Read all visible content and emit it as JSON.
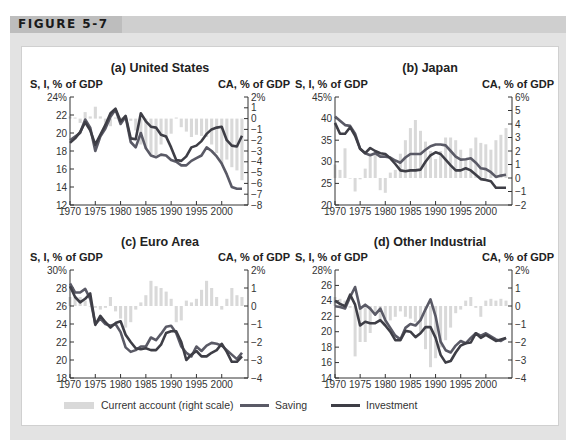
{
  "figure": {
    "label": "FIGURE 5-7"
  },
  "legend": {
    "current_account": "Current account (right scale)",
    "saving": "Saving",
    "investment": "Investment"
  },
  "colors": {
    "saving": "#5a5a66",
    "investment": "#3e3e46",
    "current_account": "#d9d9d9",
    "frame": "#e3e3e3",
    "header_band": "#cfcfcf"
  },
  "chart_data": [
    {
      "type": "line",
      "title": "(a) United States",
      "ylabel": "S, I, % of GDP",
      "y2label": "CA, % of GDP",
      "ylim": [
        12,
        24
      ],
      "yticks": [
        "24%",
        "22",
        "20",
        "18",
        "16",
        "14",
        "12"
      ],
      "y2lim": [
        -8,
        2
      ],
      "y2ticks": [
        "2%",
        "1",
        "0",
        "-1",
        "-2",
        "-3",
        "-4",
        "-5",
        "-6",
        "-7",
        "-8"
      ],
      "xticks": [
        "1970",
        "1975",
        "1980",
        "1985",
        "1990",
        "1995",
        "2000"
      ],
      "x": [
        1970,
        1971,
        1972,
        1973,
        1974,
        1975,
        1976,
        1977,
        1978,
        1979,
        1980,
        1981,
        1982,
        1983,
        1984,
        1985,
        1986,
        1987,
        1988,
        1989,
        1990,
        1991,
        1992,
        1993,
        1994,
        1995,
        1996,
        1997,
        1998,
        1999,
        2000,
        2001,
        2002,
        2003,
        2004
      ],
      "series": [
        {
          "name": "Saving",
          "axis": "left",
          "values": [
            19.2,
            19.6,
            20.0,
            21.5,
            20.6,
            18.0,
            19.6,
            20.5,
            21.8,
            22.6,
            21.0,
            21.8,
            19.0,
            18.4,
            20.0,
            18.3,
            17.5,
            17.3,
            17.6,
            17.5,
            17.0,
            16.8,
            16.4,
            16.4,
            16.9,
            17.2,
            17.5,
            18.4,
            18.0,
            17.4,
            16.6,
            15.4,
            14.0,
            13.8,
            13.8
          ]
        },
        {
          "name": "Investment",
          "axis": "left",
          "values": [
            18.9,
            19.4,
            20.1,
            21.2,
            20.3,
            18.7,
            19.8,
            20.9,
            22.2,
            22.7,
            21.3,
            21.9,
            19.4,
            19.3,
            22.2,
            21.3,
            20.7,
            20.6,
            19.8,
            19.6,
            18.4,
            17.0,
            16.9,
            17.4,
            18.4,
            18.6,
            19.1,
            19.9,
            20.4,
            20.6,
            20.7,
            19.2,
            18.6,
            18.5,
            19.7
          ]
        },
        {
          "name": "Current account",
          "axis": "right",
          "type": "bar",
          "values": [
            0.2,
            0.1,
            -0.4,
            0.6,
            0.2,
            1.1,
            0.2,
            -0.7,
            -0.7,
            0.1,
            0.1,
            0.2,
            -0.2,
            -1.1,
            -2.4,
            -2.8,
            -3.3,
            -3.4,
            -2.4,
            -1.8,
            -1.4,
            0.1,
            -0.8,
            -1.2,
            -1.7,
            -1.5,
            -1.6,
            -1.7,
            -2.4,
            -3.2,
            -4.2,
            -3.8,
            -4.5,
            -4.8,
            -5.7
          ]
        }
      ]
    },
    {
      "type": "line",
      "title": "(b) Japan",
      "ylabel": "S, I, % of GDP",
      "y2label": "CA, % of GDP",
      "ylim": [
        20,
        45
      ],
      "yticks": [
        "45%",
        "40",
        "35",
        "30",
        "25",
        "20"
      ],
      "y2lim": [
        -2,
        6
      ],
      "y2ticks": [
        "6%",
        "5",
        "4",
        "3",
        "2",
        "1",
        "0",
        "-1",
        "-2"
      ],
      "xticks": [
        "1970",
        "1975",
        "1980",
        "1985",
        "1990",
        "1995",
        "2000"
      ],
      "x": [
        1970,
        1971,
        1972,
        1973,
        1974,
        1975,
        1976,
        1977,
        1978,
        1979,
        1980,
        1981,
        1982,
        1983,
        1984,
        1985,
        1986,
        1987,
        1988,
        1989,
        1990,
        1991,
        1992,
        1993,
        1994,
        1995,
        1996,
        1997,
        1998,
        1999,
        2000,
        2001,
        2002,
        2003,
        2004
      ],
      "series": [
        {
          "name": "Saving",
          "axis": "left",
          "values": [
            40.5,
            39.5,
            38.5,
            38.3,
            36.5,
            33.0,
            32.0,
            31.5,
            32.0,
            31.2,
            31.2,
            31.0,
            30.3,
            29.8,
            31.0,
            31.8,
            31.8,
            31.8,
            32.8,
            33.6,
            34.0,
            34.0,
            33.8,
            32.5,
            31.2,
            30.5,
            30.6,
            30.8,
            29.8,
            28.5,
            28.3,
            27.6,
            26.5,
            26.8,
            27.0
          ]
        },
        {
          "name": "Investment",
          "axis": "left",
          "values": [
            39.0,
            36.5,
            36.5,
            38.0,
            36.0,
            33.0,
            32.0,
            33.2,
            32.5,
            32.0,
            31.8,
            30.8,
            29.5,
            28.0,
            27.8,
            28.0,
            28.0,
            28.2,
            30.0,
            31.5,
            32.2,
            31.8,
            30.5,
            29.2,
            28.0,
            28.0,
            28.5,
            28.0,
            27.0,
            26.0,
            25.8,
            25.5,
            24.0,
            24.0,
            24.0
          ]
        },
        {
          "name": "Current account",
          "axis": "right",
          "type": "bar",
          "values": [
            1.0,
            0.6,
            2.2,
            0,
            -1.0,
            -0.1,
            0.7,
            1.6,
            1.7,
            -0.9,
            -1.1,
            0.4,
            0.6,
            1.8,
            2.8,
            3.7,
            4.3,
            3.5,
            2.7,
            2.0,
            1.4,
            2.0,
            3.0,
            3.0,
            2.8,
            2.1,
            1.4,
            2.2,
            3.0,
            2.6,
            2.5,
            2.1,
            2.8,
            3.2,
            3.7
          ]
        }
      ]
    },
    {
      "type": "line",
      "title": "(c) Euro Area",
      "ylabel": "S, I, % of GDP",
      "y2label": "CA, % of GDP",
      "ylim": [
        18,
        30
      ],
      "yticks": [
        "30%",
        "28",
        "26",
        "24",
        "22",
        "20",
        "18"
      ],
      "y2lim": [
        -4,
        2
      ],
      "y2ticks": [
        "2%",
        "1",
        "0",
        "-1",
        "-2",
        "-3",
        "-4"
      ],
      "xticks": [
        "1970",
        "1975",
        "1980",
        "1985",
        "1990",
        "1995",
        "2000"
      ],
      "x": [
        1970,
        1971,
        1972,
        1973,
        1974,
        1975,
        1976,
        1977,
        1978,
        1979,
        1980,
        1981,
        1982,
        1983,
        1984,
        1985,
        1986,
        1987,
        1988,
        1989,
        1990,
        1991,
        1992,
        1993,
        1994,
        1995,
        1996,
        1997,
        1998,
        1999,
        2000,
        2001,
        2002,
        2003,
        2004
      ],
      "series": [
        {
          "name": "Saving",
          "axis": "left",
          "values": [
            28.5,
            27.5,
            27.5,
            27.9,
            26.8,
            24.0,
            24.6,
            24.0,
            23.8,
            24.0,
            23.1,
            21.4,
            20.9,
            21.1,
            21.5,
            21.5,
            22.5,
            22.2,
            22.9,
            23.7,
            23.8,
            23.0,
            21.5,
            20.8,
            20.4,
            21.5,
            21.0,
            21.6,
            21.9,
            21.8,
            21.6,
            21.1,
            20.6,
            20.1,
            20.8
          ]
        },
        {
          "name": "Investment",
          "axis": "left",
          "values": [
            28.2,
            27.0,
            26.4,
            26.8,
            27.4,
            23.9,
            24.9,
            24.2,
            23.6,
            24.1,
            24.3,
            22.8,
            22.0,
            21.3,
            21.2,
            21.3,
            21.1,
            21.1,
            21.7,
            23.0,
            23.2,
            23.2,
            22.0,
            20.0,
            20.6,
            21.0,
            20.4,
            20.4,
            20.8,
            21.1,
            21.8,
            20.9,
            19.8,
            19.8,
            20.4
          ]
        },
        {
          "name": "Current account",
          "axis": "right",
          "type": "bar",
          "values": [
            0.5,
            0.5,
            0.5,
            0.3,
            0,
            -0.1,
            -0.2,
            -0.1,
            0.5,
            -0.3,
            -0.7,
            -1.2,
            -0.9,
            -0.2,
            0.2,
            0.6,
            1.4,
            1.1,
            1.0,
            0.8,
            0.4,
            -0.9,
            -0.8,
            0.3,
            0.2,
            0.4,
            0.9,
            1.4,
            1.0,
            0.5,
            -0.2,
            0.4,
            1.0,
            0.6,
            0.5
          ]
        }
      ]
    },
    {
      "type": "line",
      "title": "(d) Other Industrial",
      "ylabel": "S, I, % of GDP",
      "y2label": "CA, % of GDP",
      "ylim": [
        14,
        28
      ],
      "yticks": [
        "28%",
        "26",
        "24",
        "22",
        "20",
        "18",
        "16",
        "14"
      ],
      "y2lim": [
        -4,
        2
      ],
      "y2ticks": [
        "2%",
        "1",
        "0",
        "-1",
        "-2",
        "-3",
        "-4"
      ],
      "xticks": [
        "1970",
        "1975",
        "1980",
        "1985",
        "1990",
        "1995",
        "2000"
      ],
      "x": [
        1970,
        1971,
        1972,
        1973,
        1974,
        1975,
        1976,
        1977,
        1978,
        1979,
        1980,
        1981,
        1982,
        1983,
        1984,
        1985,
        1986,
        1987,
        1988,
        1989,
        1990,
        1991,
        1992,
        1993,
        1994,
        1995,
        1996,
        1997,
        1998,
        1999,
        2000,
        2001,
        2002,
        2003,
        2004
      ],
      "series": [
        {
          "name": "Saving",
          "axis": "left",
          "values": [
            23.3,
            23.2,
            23.0,
            24.5,
            25.8,
            23.0,
            23.5,
            23.0,
            22.2,
            23.0,
            21.5,
            20.5,
            19.5,
            19.0,
            20.5,
            21.0,
            20.8,
            21.5,
            22.9,
            24.2,
            22.0,
            18.7,
            17.6,
            17.3,
            18.2,
            18.8,
            18.5,
            19.2,
            19.8,
            19.5,
            19.8,
            19.4,
            19.0,
            18.8,
            19.2
          ]
        },
        {
          "name": "Investment",
          "axis": "left",
          "values": [
            24.0,
            23.6,
            23.3,
            24.8,
            23.5,
            20.8,
            21.3,
            21.1,
            21.1,
            21.5,
            20.8,
            20.0,
            18.9,
            18.9,
            20.1,
            20.0,
            19.3,
            19.8,
            20.6,
            20.6,
            19.2,
            17.0,
            16.0,
            16.2,
            17.3,
            18.2,
            18.5,
            18.6,
            19.8,
            19.2,
            19.6,
            19.2,
            18.8,
            19.0,
            19.2
          ]
        },
        {
          "name": "Current account",
          "axis": "right",
          "type": "bar",
          "values": [
            0.5,
            0.4,
            0.3,
            -0.1,
            -2.8,
            -2.0,
            -2.0,
            -1.5,
            -0.5,
            -0.9,
            -1.1,
            -0.8,
            -0.6,
            -0.3,
            -0.6,
            -0.7,
            -0.9,
            -1.5,
            -2.4,
            -3.4,
            -2.9,
            -2.3,
            -1.9,
            -1.2,
            -0.4,
            -0.2,
            0.3,
            0.5,
            -0.1,
            -0.6,
            0.3,
            0.4,
            0.3,
            0.4,
            0.3
          ]
        }
      ]
    }
  ]
}
